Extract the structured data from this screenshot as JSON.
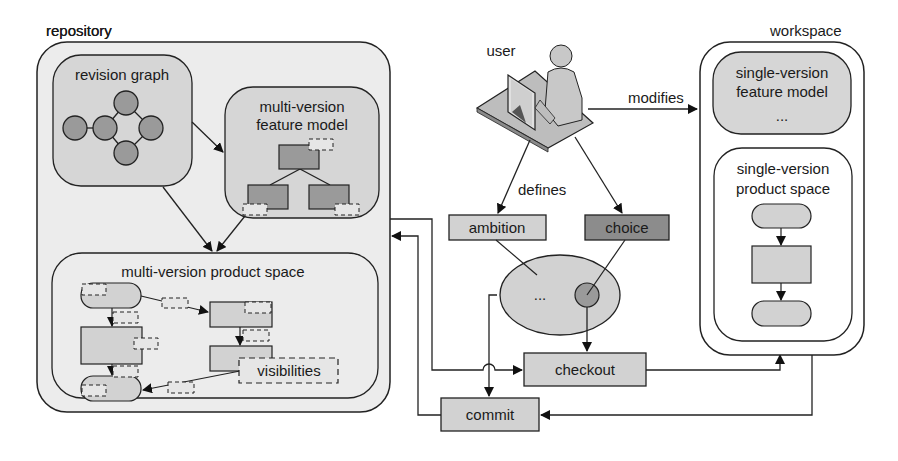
{
  "diagram": {
    "colors": {
      "background": "#ffffff",
      "outer_fill": "#ececec",
      "inner_fill": "#d6d6d6",
      "node_fill": "#9a9a9a",
      "box_fill": "#d2d2d2",
      "dark_box_fill": "#8c8c8c",
      "stroke": "#222222"
    },
    "repository": {
      "label": "repository",
      "revision_graph": {
        "label": "revision graph",
        "nodes": 6
      },
      "feature_model": {
        "label_line1": "multi-version",
        "label_line2": "feature model"
      },
      "product_space": {
        "label": "multi-version product space",
        "visibilities_label": "visibilities"
      }
    },
    "user": {
      "label": "user",
      "icon": "user-at-computer-icon",
      "modifies_label": "modifies",
      "defines_label": "defines"
    },
    "ambition": {
      "label": "ambition"
    },
    "choice": {
      "label": "choice"
    },
    "version_space": {
      "ellipsis": "..."
    },
    "checkout": {
      "label": "checkout"
    },
    "commit": {
      "label": "commit"
    },
    "workspace": {
      "label": "workspace",
      "feature_model": {
        "label_line1": "single-version",
        "label_line2": "feature model",
        "ellipsis": "..."
      },
      "product_space": {
        "label_line1": "single-version",
        "label_line2": "product space"
      }
    }
  }
}
